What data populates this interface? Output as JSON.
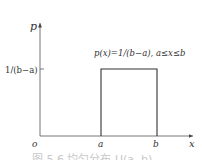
{
  "diagram": {
    "type": "uniform-distribution-pdf",
    "axes": {
      "y_label": "p",
      "x_label": "x",
      "origin_label": "o"
    },
    "y_tick_label": "1/(b−a)",
    "x_tick_labels": [
      "a",
      "b"
    ],
    "formula": "p(x)=1/(b−a), a≤x≤b",
    "caption": "图 5.6  均匀分布 U(a, b)",
    "colors": {
      "line": "#333333",
      "axis": "#555555",
      "caption": "#c8c8c8"
    }
  }
}
